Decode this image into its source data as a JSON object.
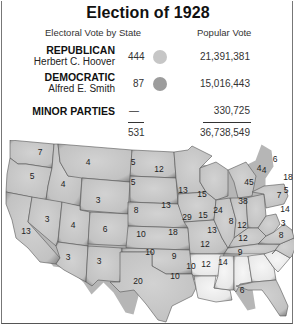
{
  "title": "Election of 1928",
  "headers": {
    "electoral": "Electoral Vote by State",
    "popular": "Popular Vote"
  },
  "parties": [
    {
      "name": "REPUBLICAN",
      "candidate": "Herbert C. Hoover",
      "electoral_votes": "444",
      "popular_vote": "21,391,381",
      "color": "#c6c6c6"
    },
    {
      "name": "DEMOCRATIC",
      "candidate": "Alfred E. Smith",
      "electoral_votes": "87",
      "popular_vote": "15,016,443",
      "color": "#9c9c9c"
    },
    {
      "name": "MINOR PARTIES",
      "candidate": "",
      "electoral_votes": "—",
      "popular_vote": "330,725"
    }
  ],
  "totals": {
    "electoral_votes": "531",
    "popular_vote": "36,738,549"
  },
  "map": {
    "republican_fill": "#c9c9c9",
    "democratic_fill": "#eeeeee",
    "states": [
      {
        "id": "WA",
        "ev": "7",
        "party": "R"
      },
      {
        "id": "OR",
        "ev": "5",
        "party": "R"
      },
      {
        "id": "CA",
        "ev": "13",
        "party": "R"
      },
      {
        "id": "ID",
        "ev": "4",
        "party": "R"
      },
      {
        "id": "NV",
        "ev": "3",
        "party": "R"
      },
      {
        "id": "MT",
        "ev": "4",
        "party": "R"
      },
      {
        "id": "WY",
        "ev": "3",
        "party": "R"
      },
      {
        "id": "UT",
        "ev": "4",
        "party": "R"
      },
      {
        "id": "AZ",
        "ev": "3",
        "party": "R"
      },
      {
        "id": "CO",
        "ev": "6",
        "party": "R"
      },
      {
        "id": "NM",
        "ev": "3",
        "party": "R"
      },
      {
        "id": "ND",
        "ev": "5",
        "party": "R"
      },
      {
        "id": "SD",
        "ev": "5",
        "party": "R"
      },
      {
        "id": "NE",
        "ev": "8",
        "party": "R"
      },
      {
        "id": "KS",
        "ev": "10",
        "party": "R"
      },
      {
        "id": "OK",
        "ev": "10",
        "party": "R"
      },
      {
        "id": "TX",
        "ev": "20",
        "party": "R"
      },
      {
        "id": "MN",
        "ev": "12",
        "party": "R"
      },
      {
        "id": "IA",
        "ev": "13",
        "party": "R"
      },
      {
        "id": "MO",
        "ev": "18",
        "party": "R"
      },
      {
        "id": "AR",
        "ev": "9",
        "party": "D"
      },
      {
        "id": "LA",
        "ev": "10",
        "party": "D"
      },
      {
        "id": "WI",
        "ev": "13",
        "party": "R"
      },
      {
        "id": "IL",
        "ev": "29",
        "party": "R"
      },
      {
        "id": "MI",
        "ev": "15",
        "party": "R"
      },
      {
        "id": "IN",
        "ev": "15",
        "party": "R"
      },
      {
        "id": "OH",
        "ev": "24",
        "party": "R"
      },
      {
        "id": "KY",
        "ev": "13",
        "party": "R"
      },
      {
        "id": "TN",
        "ev": "12",
        "party": "R"
      },
      {
        "id": "MS",
        "ev": "10",
        "party": "D"
      },
      {
        "id": "AL",
        "ev": "12",
        "party": "D"
      },
      {
        "id": "GA",
        "ev": "14",
        "party": "D"
      },
      {
        "id": "SC",
        "ev": "9",
        "party": "D"
      },
      {
        "id": "FL",
        "ev": "6",
        "party": "R"
      },
      {
        "id": "NC",
        "ev": "12",
        "party": "R"
      },
      {
        "id": "VA",
        "ev": "12",
        "party": "R"
      },
      {
        "id": "WV",
        "ev": "8",
        "party": "R"
      },
      {
        "id": "PA",
        "ev": "38",
        "party": "R"
      },
      {
        "id": "NY",
        "ev": "45",
        "party": "R"
      },
      {
        "id": "VT",
        "ev": "4",
        "party": "R"
      },
      {
        "id": "NH",
        "ev": "4",
        "party": "R"
      },
      {
        "id": "ME",
        "ev": "6",
        "party": "R"
      },
      {
        "id": "MA",
        "ev": "18",
        "party": "D"
      },
      {
        "id": "RI",
        "ev": "5",
        "party": "D"
      },
      {
        "id": "CT",
        "ev": "7",
        "party": "R"
      },
      {
        "id": "NJ",
        "ev": "14",
        "party": "R"
      },
      {
        "id": "DE",
        "ev": "3",
        "party": "R"
      },
      {
        "id": "MD",
        "ev": "8",
        "party": "R"
      }
    ]
  }
}
